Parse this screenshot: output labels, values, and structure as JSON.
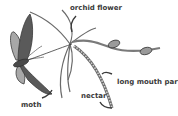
{
  "diagram": {
    "labels": {
      "orchid_flower": "orchid flower",
      "long_mouth_part": "long mouth part",
      "nectar": "nectar",
      "moth": "moth"
    },
    "colors": {
      "wing_dark": "#5a5a5a",
      "wing_light": "#a8a8a8",
      "outline": "#3a3a3a",
      "petal": "#ffffff",
      "stem_leaf": "#9a9a9a",
      "spur": "#c8c8c8"
    }
  }
}
